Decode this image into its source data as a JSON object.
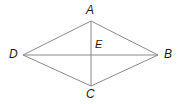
{
  "figure": {
    "type": "geometry-diagram",
    "shape": "rhombus",
    "background_color": "#ffffff",
    "line_color": "#8a8a8a",
    "label_color": "#1c1c1c",
    "labels": {
      "A": "A",
      "B": "B",
      "C": "C",
      "D": "D",
      "E": "E"
    },
    "points": {
      "A": {
        "x": 91,
        "y": 21
      },
      "B": {
        "x": 158,
        "y": 55
      },
      "C": {
        "x": 91,
        "y": 86
      },
      "D": {
        "x": 23,
        "y": 55
      },
      "E": {
        "x": 91,
        "y": 55
      }
    },
    "segments": [
      {
        "name": "AB",
        "from": "A",
        "to": "B"
      },
      {
        "name": "BC",
        "from": "B",
        "to": "C"
      },
      {
        "name": "CD",
        "from": "C",
        "to": "D"
      },
      {
        "name": "DA",
        "from": "D",
        "to": "A"
      },
      {
        "name": "AC",
        "from": "A",
        "to": "C"
      },
      {
        "name": "DB",
        "from": "D",
        "to": "B"
      }
    ]
  }
}
